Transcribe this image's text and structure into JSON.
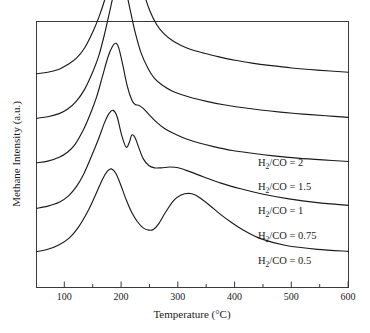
{
  "chart_data": {
    "type": "line",
    "title": "",
    "xlabel": "Temperature (°C)",
    "ylabel": "Methane Intensity (a.u.)",
    "xlim": [
      50,
      600
    ],
    "ylim": [
      0,
      1
    ],
    "grid": false,
    "legend_position": "inline-right",
    "x_ticks": [
      100,
      200,
      300,
      400,
      500,
      600
    ],
    "x_minor_ticks": [
      50,
      150,
      250,
      350,
      450,
      550
    ],
    "y_ticks": [],
    "y_tick_labels": [],
    "series": [
      {
        "name": "H2/CO = 2",
        "label_html": "H<sub>2</sub>/CO = 2",
        "label_text": "H2/CO = 2",
        "baseline_offset": 0.78,
        "peak_temperature": 210,
        "peak_height": 1.0,
        "x": [
          50,
          70,
          90,
          105,
          120,
          135,
          150,
          160,
          170,
          180,
          190,
          198,
          205,
          210,
          215,
          222,
          230,
          240,
          250,
          262,
          275,
          290,
          305,
          325,
          345,
          370,
          400,
          430,
          460,
          500,
          545,
          600
        ],
        "values": [
          0.02,
          0.03,
          0.05,
          0.08,
          0.12,
          0.19,
          0.3,
          0.39,
          0.5,
          0.64,
          0.8,
          0.91,
          0.985,
          1.0,
          0.97,
          0.86,
          0.7,
          0.54,
          0.43,
          0.34,
          0.28,
          0.235,
          0.205,
          0.175,
          0.155,
          0.132,
          0.108,
          0.09,
          0.075,
          0.058,
          0.044,
          0.03
        ]
      },
      {
        "name": "H2/CO = 1.5",
        "label_html": "H<sub>2</sub>/CO = 1.5",
        "label_text": "H2/CO = 1.5",
        "baseline_offset": 0.6,
        "peak_temperature": 200,
        "peak_height": 0.93,
        "x": [
          50,
          70,
          90,
          105,
          120,
          135,
          150,
          160,
          170,
          178,
          186,
          193,
          198,
          202,
          208,
          215,
          224,
          234,
          246,
          258,
          272,
          288,
          305,
          325,
          350,
          380,
          412,
          445,
          480,
          520,
          560,
          600
        ],
        "values": [
          0.02,
          0.03,
          0.05,
          0.08,
          0.13,
          0.21,
          0.33,
          0.43,
          0.57,
          0.7,
          0.83,
          0.91,
          0.93,
          0.92,
          0.85,
          0.73,
          0.58,
          0.45,
          0.35,
          0.28,
          0.235,
          0.2,
          0.175,
          0.152,
          0.13,
          0.108,
          0.09,
          0.074,
          0.06,
          0.047,
          0.036,
          0.026
        ]
      },
      {
        "name": "H2/CO = 1",
        "label_html": "H<sub>2</sub>/CO = 1",
        "label_text": "H2/CO = 1",
        "baseline_offset": 0.42,
        "peak_temperature": 190,
        "peak_height": 0.8,
        "shoulder_temperature": 225,
        "x": [
          50,
          70,
          90,
          105,
          118,
          132,
          145,
          156,
          166,
          176,
          184,
          190,
          195,
          202,
          210,
          218,
          224,
          230,
          238,
          248,
          260,
          275,
          292,
          312,
          335,
          362,
          395,
          430,
          468,
          510,
          555,
          600
        ],
        "values": [
          0.02,
          0.03,
          0.055,
          0.09,
          0.14,
          0.23,
          0.34,
          0.45,
          0.58,
          0.71,
          0.78,
          0.8,
          0.77,
          0.66,
          0.52,
          0.43,
          0.4,
          0.395,
          0.375,
          0.335,
          0.29,
          0.245,
          0.21,
          0.178,
          0.15,
          0.125,
          0.1,
          0.082,
          0.065,
          0.05,
          0.038,
          0.028
        ]
      },
      {
        "name": "H2/CO = 0.75",
        "label_html": "H<sub>2</sub>/CO = 0.75",
        "label_text": "H2/CO = 0.75",
        "baseline_offset": 0.235,
        "peak_temperature": 185,
        "peak_height": 0.66,
        "second_peak_temperature": 218,
        "second_peak_height": 0.5,
        "x": [
          50,
          70,
          90,
          106,
          120,
          134,
          148,
          160,
          170,
          178,
          185,
          192,
          200,
          208,
          214,
          218,
          224,
          230,
          238,
          248,
          258,
          270,
          285,
          300,
          320,
          345,
          375,
          410,
          450,
          495,
          545,
          600
        ],
        "values": [
          0.02,
          0.035,
          0.06,
          0.1,
          0.16,
          0.25,
          0.37,
          0.48,
          0.58,
          0.64,
          0.66,
          0.62,
          0.5,
          0.42,
          0.455,
          0.5,
          0.48,
          0.42,
          0.345,
          0.3,
          0.285,
          0.285,
          0.29,
          0.285,
          0.26,
          0.225,
          0.185,
          0.148,
          0.112,
          0.082,
          0.058,
          0.04
        ]
      },
      {
        "name": "H2/CO = 0.5",
        "label_html": "H<sub>2</sub>/CO = 0.5",
        "label_text": "H2/CO = 0.5",
        "baseline_offset": 0.06,
        "peak_temperature": 180,
        "peak_height": 0.56,
        "broad_hump_temperature": 320,
        "broad_hump_height": 0.4,
        "x": [
          50,
          70,
          90,
          108,
          124,
          140,
          154,
          166,
          175,
          182,
          190,
          198,
          208,
          218,
          228,
          238,
          248,
          256,
          265,
          278,
          292,
          305,
          318,
          330,
          342,
          356,
          372,
          392,
          415,
          445,
          490,
          545,
          600
        ],
        "values": [
          0.02,
          0.035,
          0.065,
          0.11,
          0.18,
          0.28,
          0.39,
          0.49,
          0.545,
          0.56,
          0.53,
          0.46,
          0.36,
          0.275,
          0.215,
          0.175,
          0.16,
          0.165,
          0.2,
          0.28,
          0.355,
          0.39,
          0.4,
          0.39,
          0.36,
          0.32,
          0.27,
          0.215,
          0.16,
          0.105,
          0.06,
          0.035,
          0.022
        ]
      }
    ]
  },
  "colors": {
    "curve": "#1b1b1b",
    "frame": "#3a3a3a",
    "background": "#ffffff",
    "text": "#1a1a1a"
  },
  "labels": {
    "s1": "H",
    "s1_sub": "2",
    "s1_rest": "/CO = 2",
    "s2_rest": "/CO = 1.5",
    "s3_rest": "/CO = 1",
    "s4_rest": "/CO = 0.75",
    "s5_rest": "/CO = 0.5"
  },
  "ticks": {
    "t100": "100",
    "t200": "200",
    "t300": "300",
    "t400": "400",
    "t500": "500",
    "t600": "600"
  }
}
